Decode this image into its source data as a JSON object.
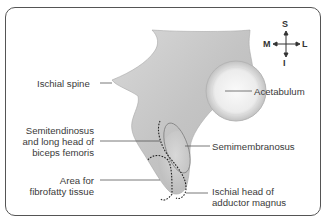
{
  "diagram": {
    "labels": {
      "ischial_spine": "Ischial spine",
      "acetabulum": "Acetabulum",
      "semitendinosus_l1": "Semitendinosus",
      "semitendinosus_l2": "and long head of",
      "semitendinosus_l3": "biceps femoris",
      "semimembranosus": "Semimembranosus",
      "area_l1": "Area for",
      "area_l2": "fibrofatty tissue",
      "adductor_l1": "Ischial head of",
      "adductor_l2": "adductor magnus"
    },
    "compass": {
      "superior": "S",
      "inferior": "I",
      "medial": "M",
      "lateral": "L"
    },
    "colors": {
      "border": "#555555",
      "bone": "#c8c8c8",
      "leader": "#555555",
      "text": "#3a3a3a"
    }
  }
}
